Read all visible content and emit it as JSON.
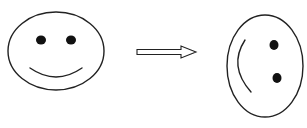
{
  "diagram": {
    "type": "transformation",
    "description": "Smiley face rotated 90 degrees clockwise",
    "colors": {
      "background": "#ffffff",
      "stroke": "#222222",
      "fill": "#111111"
    },
    "nodes": [
      {
        "id": "face-upright",
        "label": "Upright smiley face",
        "shape": "ellipse",
        "center": [
          56,
          51
        ],
        "rx": 48,
        "ry": 39,
        "eyes": [
          [
            41,
            40
          ],
          [
            71,
            40
          ]
        ],
        "eye_radius": 5,
        "mouth": {
          "from": [
            30,
            68
          ],
          "control": [
            56,
            86
          ],
          "to": [
            82,
            68
          ]
        }
      },
      {
        "id": "face-rotated",
        "label": "Rotated smiley face",
        "shape": "ellipse",
        "center": [
          265,
          66
        ],
        "rx": 38,
        "ry": 51,
        "eyes": [
          [
            274,
            45
          ],
          [
            277,
            78
          ]
        ],
        "eye_radius": 5,
        "mouth": {
          "from": [
            245,
            40
          ],
          "control": [
            228,
            66
          ],
          "to": [
            251,
            92
          ]
        }
      }
    ],
    "edges": [
      {
        "id": "transform-arrow",
        "label": "Transforms to",
        "from": "face-upright",
        "to": "face-rotated",
        "style": "hollow-block-arrow"
      }
    ]
  }
}
